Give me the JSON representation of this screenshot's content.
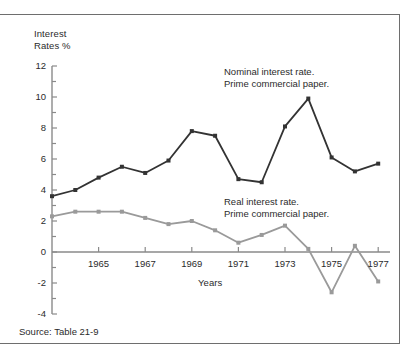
{
  "figure": {
    "source_note": "Source: Table 21-9"
  },
  "chart_data": {
    "type": "line",
    "title": "",
    "subtitle": "",
    "xlabel": "Years",
    "ylabel": "Interest\nRates %",
    "ylabel_line1": "Interest",
    "ylabel_line2": "Rates %",
    "x": [
      1963,
      1964,
      1965,
      1966,
      1967,
      1968,
      1969,
      1970,
      1971,
      1972,
      1973,
      1974,
      1975,
      1976,
      1977
    ],
    "xlim": [
      1963,
      1977.5
    ],
    "ylim": [
      -4,
      12
    ],
    "grid": false,
    "legend_position": "inline-annotation",
    "y_ticks_major": [
      12,
      10,
      8,
      6,
      4,
      2,
      0,
      -2,
      -4
    ],
    "y_ticks_minor": [
      11,
      9,
      7,
      5,
      3,
      1,
      -1,
      -3
    ],
    "y_tick_labels": [
      "12",
      "10",
      "8",
      "6",
      "4",
      "2",
      "0",
      "-2",
      "-4"
    ],
    "x_ticks_major": [
      1965,
      1967,
      1969,
      1971,
      1973,
      1975,
      1977
    ],
    "x_tick_labels": [
      "1965",
      "1967",
      "1969",
      "1971",
      "1973",
      "1975",
      "1977"
    ],
    "zero_line": 0,
    "series": [
      {
        "name": "Nominal interest rate. Prime commercial paper.",
        "label_line1": "Nominal interest rate.",
        "label_line2": "Prime commercial paper.",
        "color": "#333333",
        "values": [
          3.6,
          4.0,
          4.8,
          5.5,
          5.1,
          5.9,
          7.8,
          7.5,
          4.7,
          4.5,
          8.1,
          9.9,
          6.1,
          5.2,
          5.7
        ]
      },
      {
        "name": "Real interest rate. Prime commercial paper.",
        "label_line1": "Real interest rate.",
        "label_line2": "Prime commercial paper.",
        "color": "#9a9a9a",
        "values": [
          2.3,
          2.6,
          2.6,
          2.6,
          2.2,
          1.8,
          2.0,
          1.4,
          0.6,
          1.1,
          1.7,
          0.2,
          -2.6,
          0.4,
          -1.9
        ]
      }
    ]
  },
  "colors": {
    "nominal": "#333333",
    "real": "#9a9a9a",
    "axis": "#8a8a8a",
    "text": "#2b2b2b",
    "frame": "#6e6e6e",
    "background": "#ffffff"
  }
}
